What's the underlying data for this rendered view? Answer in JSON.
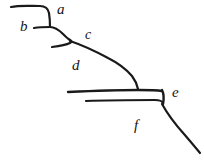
{
  "figure": {
    "background_color": "#ffffff",
    "ink_color": "#1a1a1a",
    "width": 204,
    "height": 160,
    "style": "hand-drawn pen sketch, no axes, no grid"
  },
  "labels": [
    {
      "id": "a",
      "text": "a",
      "x": 57,
      "y": 14,
      "font_size": 15
    },
    {
      "id": "b",
      "text": "b",
      "x": 20,
      "y": 31,
      "font_size": 15
    },
    {
      "id": "c",
      "text": "c",
      "x": 85,
      "y": 39,
      "font_size": 14
    },
    {
      "id": "d",
      "text": "d",
      "x": 72,
      "y": 70,
      "font_size": 15
    },
    {
      "id": "e",
      "text": "e",
      "x": 172,
      "y": 97,
      "font_size": 15
    },
    {
      "id": "f",
      "text": "f",
      "x": 134,
      "y": 130,
      "font_size": 15
    }
  ],
  "strokes": [
    {
      "id": "upper-terrace-top",
      "name": "top-ledge-a",
      "width": 2.2,
      "d": "M 11 7 C 20 5, 30 6, 40 6 C 45 6, 48 8, 49 13 C 50 19, 50 24, 50 27"
    },
    {
      "id": "terrace-b-riser",
      "name": "riser-below-b",
      "width": 2.2,
      "d": "M 34 28 C 40 27, 46 27, 50 27 C 55 27, 59 30, 63 34 C 66 37, 68 39, 70 40"
    },
    {
      "id": "terrace-c-tread",
      "name": "tread-c",
      "width": 2.2,
      "d": "M 52 47 C 60 46, 66 45, 70 43 C 72 42, 72 41, 70 40"
    },
    {
      "id": "slope-c-to-d",
      "name": "slope-c-d",
      "width": 2.2,
      "d": "M 70 41 C 82 45, 95 51, 108 58 C 118 63, 126 69, 132 76 C 135 80, 137 84, 138 89"
    },
    {
      "id": "mid-platform-upper",
      "name": "platform-upper-line",
      "width": 2.4,
      "d": "M 68 92 C 90 91, 115 90, 138 90 C 148 90, 156 90, 162 91"
    },
    {
      "id": "mid-platform-lower",
      "name": "platform-lower-line",
      "width": 2.2,
      "d": "M 86 101 C 110 100, 135 100, 155 100 C 159 100, 162 101, 163 103"
    },
    {
      "id": "platform-right-riser",
      "name": "riser-at-e",
      "width": 2.4,
      "d": "M 162 90 C 164 94, 164 99, 163 104"
    },
    {
      "id": "slope-e-to-bottom",
      "name": "slope-e-descending",
      "width": 2.2,
      "d": "M 162 104 C 167 113, 175 124, 184 134 C 190 141, 196 148, 200 153"
    }
  ]
}
